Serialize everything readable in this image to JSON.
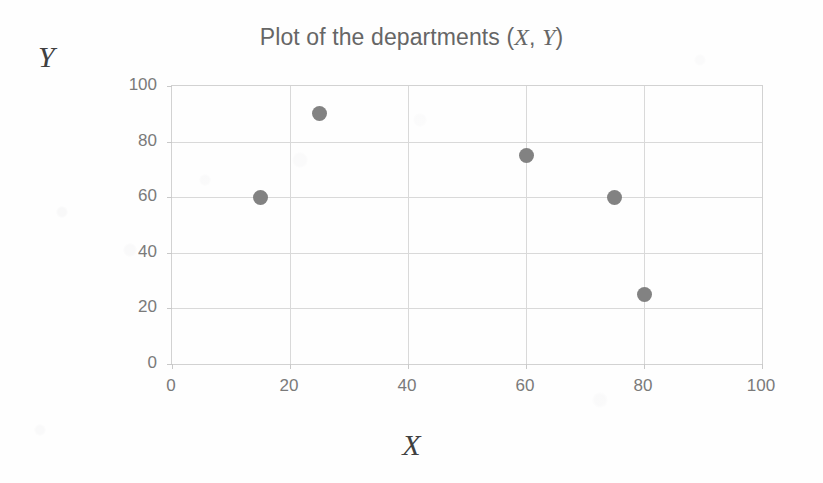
{
  "chart_data": {
    "type": "scatter",
    "title": "Plot of the departments (X, Y)",
    "title_parts": {
      "lead": "Plot of the departments (",
      "x_sym": "X",
      "mid": ", ",
      "y_sym": "Y",
      "tail": ")"
    },
    "xlabel": "X",
    "ylabel": "Y",
    "xlim": [
      0,
      100
    ],
    "ylim": [
      0,
      100
    ],
    "grid": true,
    "legend": false,
    "xticks": [
      0,
      20,
      40,
      60,
      80,
      100
    ],
    "yticks": [
      0,
      20,
      40,
      60,
      80,
      100
    ],
    "xtick_labels": [
      "0",
      "20",
      "40",
      "60",
      "80",
      "100"
    ],
    "ytick_labels": [
      "0",
      "20",
      "40",
      "60",
      "80",
      "100"
    ],
    "marker_color": "#828282",
    "gridline_color": "#d9d9d9",
    "axis_color": "#d2d2d2",
    "title_color": "#666666",
    "tick_label_color": "#7a7a7a",
    "series": [
      {
        "name": "departments",
        "points": [
          {
            "x": 15,
            "y": 60
          },
          {
            "x": 25,
            "y": 90
          },
          {
            "x": 60,
            "y": 75
          },
          {
            "x": 75,
            "y": 60
          },
          {
            "x": 80,
            "y": 25
          }
        ]
      }
    ],
    "x": [
      15,
      25,
      60,
      75,
      80
    ],
    "values": [
      60,
      90,
      75,
      60,
      25
    ]
  }
}
